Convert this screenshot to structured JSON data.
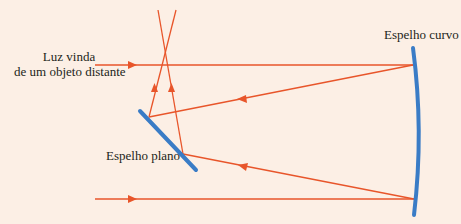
{
  "labels": {
    "light_source_line1": "Luz vinda",
    "light_source_line2": "de um objeto distante",
    "curved_mirror": "Espelho curvo",
    "flat_mirror": "Espelho plano"
  },
  "colors": {
    "background": "#fcefe5",
    "ray": "#e8552a",
    "mirror": "#3a7cc6",
    "text": "#231f20"
  }
}
